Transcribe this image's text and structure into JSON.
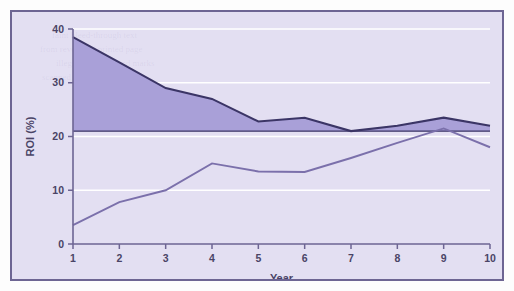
{
  "chart_data": {
    "type": "line",
    "title": "",
    "subtitle": "",
    "xlabel": "Year",
    "ylabel": "ROI (%)",
    "x": [
      1,
      2,
      3,
      4,
      5,
      6,
      7,
      8,
      9,
      10
    ],
    "xticklabels": [
      "1",
      "2",
      "3",
      "4",
      "5",
      "6",
      "7",
      "8",
      "9",
      "10"
    ],
    "yticklabels": [
      "0",
      "10",
      "20",
      "30",
      "40"
    ],
    "yticks": [
      0,
      10,
      20,
      30,
      40
    ],
    "xlim": [
      1,
      10
    ],
    "ylim": [
      0,
      40
    ],
    "grid": "horizontal-white",
    "legend": "none",
    "reference_line": {
      "name": "baseline",
      "value": 21,
      "orientation": "horizontal"
    },
    "series": [
      {
        "name": "Upper ROI curve (shaded to baseline)",
        "values": [
          38.5,
          33.8,
          29.0,
          27.0,
          22.8,
          23.5,
          21.0,
          22.0,
          23.5,
          22.0
        ],
        "filled": true
      },
      {
        "name": "Lower ROI curve",
        "values": [
          3.5,
          7.8,
          10.0,
          15.0,
          13.5,
          13.4,
          16.0,
          18.8,
          21.5,
          18.0
        ],
        "filled": false
      }
    ],
    "colors": {
      "plot_background": "#e3dff2",
      "fill": "#a9a0d8",
      "line_dark": "#3b3566",
      "line_light": "#7b70ab",
      "gridline": "#ffffff",
      "axis": "#6d6593",
      "frame_border": "#6d6593",
      "text": "#4a4466"
    }
  },
  "ghost_text": {
    "lines": [
      "faint bleed-through text",
      "from reverse of printed page",
      "illegible background marks",
      "scanned paper artifact"
    ]
  }
}
